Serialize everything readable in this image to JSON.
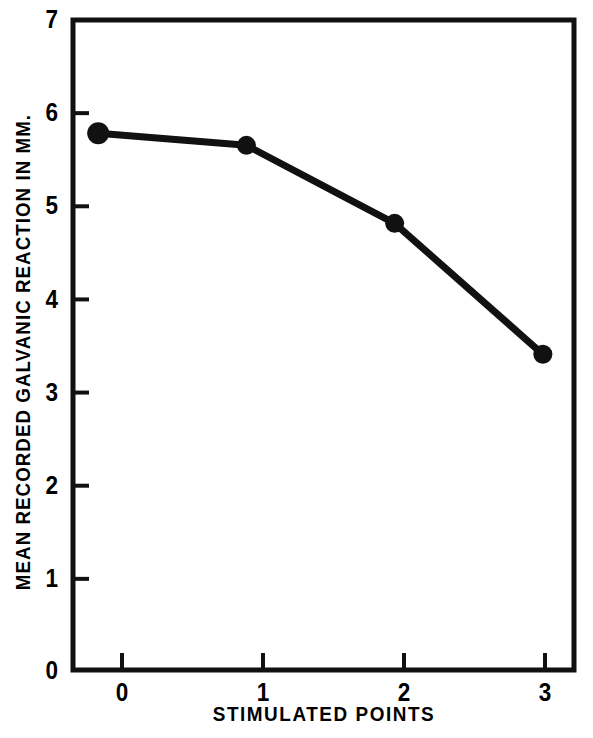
{
  "chart_data": {
    "type": "line",
    "title": "",
    "xlabel": "STIMULATED POINTS",
    "ylabel": "MEAN RECORDED GALVANIC REACTION IN MM.",
    "x": [
      0,
      1,
      2,
      3
    ],
    "values": [
      5.78,
      5.65,
      4.81,
      3.4
    ],
    "series": [
      {
        "name": "Mean recorded galvanic reaction",
        "values": [
          5.78,
          5.65,
          4.81,
          3.4
        ]
      }
    ],
    "xlim": [
      -0.17,
      3.21
    ],
    "ylim": [
      0,
      7
    ],
    "xticks": [
      0,
      1,
      2,
      3
    ],
    "xtick_labels": [
      "0",
      "1",
      "2",
      "3"
    ],
    "yticks": [
      0,
      1,
      2,
      3,
      4,
      5,
      6,
      7
    ],
    "ytick_labels": [
      "0",
      "1",
      "2",
      "3",
      "4",
      "5",
      "6",
      "7"
    ],
    "grid": false,
    "legend": false,
    "legend_position": "none",
    "marker": "filled-circle",
    "line_color": "#111111",
    "marker_color": "#111111",
    "background_color": "#ffffff",
    "frame": "full-box",
    "tick_direction": "in",
    "annotations": []
  },
  "figure": {
    "axis_color": "#111111",
    "text_color": "#000000"
  }
}
